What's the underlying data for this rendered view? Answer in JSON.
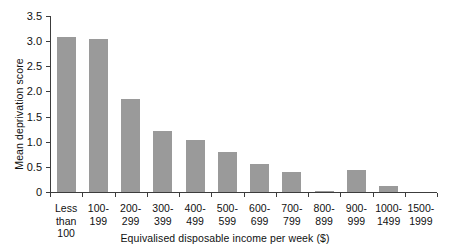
{
  "chart_data": {
    "type": "bar",
    "title": "",
    "xlabel": "Equivalised disposable income per week ($)",
    "ylabel": "Mean deprivation score",
    "ylim": [
      0,
      3.5
    ],
    "yticks": [
      "0",
      "0.5",
      "1.0",
      "1.5",
      "2.0",
      "2.5",
      "3.0",
      "3.5"
    ],
    "ytick_values": [
      0,
      0.5,
      1.0,
      1.5,
      2.0,
      2.5,
      3.0,
      3.5
    ],
    "grid": false,
    "legend": "none",
    "bar_color": "#9a9a9a",
    "axis_color": "#3c3c3c",
    "categories": [
      "Less\nthan\n100",
      "100-\n199",
      "200-\n299",
      "300-\n399",
      "400-\n499",
      "500-\n599",
      "600-\n699",
      "700-\n799",
      "800-\n899",
      "900-\n999",
      "1000-\n1499",
      "1500-\n1999"
    ],
    "values": [
      3.08,
      3.04,
      1.85,
      1.22,
      1.04,
      0.79,
      0.55,
      0.4,
      0.03,
      0.44,
      0.12,
      0.0
    ]
  }
}
